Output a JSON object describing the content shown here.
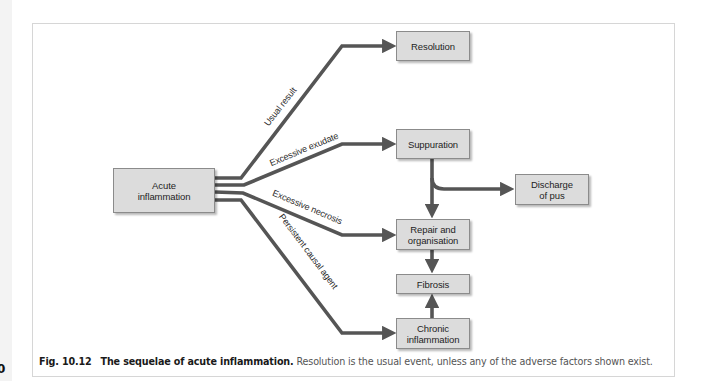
{
  "page": {
    "page_number_fragment": "0"
  },
  "colors": {
    "box_fill": "#dcdcdc",
    "box_border": "#8b8b8b",
    "line": "#555555",
    "frame_border": "#d6d6d6"
  },
  "nodes": {
    "acute": {
      "label": "Acute\ninflammation"
    },
    "resolution": {
      "label": "Resolution"
    },
    "suppuration": {
      "label": "Suppuration"
    },
    "discharge": {
      "label": "Discharge\nof pus"
    },
    "repair": {
      "label": "Repair and\norganisation"
    },
    "fibrosis": {
      "label": "Fibrosis"
    },
    "chronic": {
      "label": "Chronic\ninflammation"
    }
  },
  "edges": [
    {
      "from": "acute",
      "to": "resolution",
      "label": "Usual result"
    },
    {
      "from": "acute",
      "to": "suppuration",
      "label": "Excessive exudate"
    },
    {
      "from": "acute",
      "to": "repair",
      "label": "Excessive necrosis"
    },
    {
      "from": "acute",
      "to": "chronic",
      "label": "Persistent causal agent"
    },
    {
      "from": "suppuration",
      "to": "discharge",
      "label": ""
    },
    {
      "from": "suppuration",
      "to": "repair",
      "label": ""
    },
    {
      "from": "repair",
      "to": "fibrosis",
      "label": ""
    },
    {
      "from": "chronic",
      "to": "fibrosis",
      "label": ""
    }
  ],
  "caption": {
    "figure_number": "Fig. 10.12",
    "title": "The sequelae of acute inflammation.",
    "text": " Resolution is the usual event, unless any of the adverse factors shown exist."
  }
}
